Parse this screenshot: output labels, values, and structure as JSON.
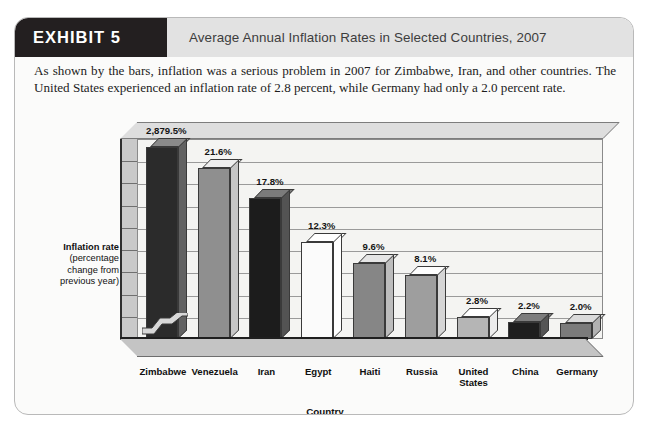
{
  "exhibit": {
    "tag": "EXHIBIT 5",
    "title": "Average Annual Inflation Rates in Selected Countries, 2007",
    "description": "As shown by the bars, inflation was a serious problem in 2007 for Zimbabwe, Iran, and other countries. The United States experienced an inflation rate of 2.8 percent, while Germany had only a 2.0 percent rate."
  },
  "axis_caption": {
    "line1": "Inflation rate",
    "line2": "(percentage",
    "line3": "change from",
    "line4": "previous year)"
  },
  "colors": {
    "tag_background": "#231f20",
    "header_background": "#e2e2e2",
    "card_background": "#fbfbfa",
    "plot_background": "#f4f4f2",
    "wall_gray": "#c9c9c9",
    "floor_gray": "#c4c4c4"
  },
  "chart_data": {
    "type": "bar",
    "title": "Average Annual Inflation Rates in Selected Countries, 2007",
    "xlabel": "Country",
    "ylabel": "Inflation rate (percentage change from previous year)",
    "grid": true,
    "legend": "none",
    "axis_break": true,
    "axis_break_note": "Zimbabwe bar is truncated with a scale-break symbol",
    "ylim": [
      0,
      24
    ],
    "categories": [
      "Zimbabwe",
      "Venezuela",
      "Iran",
      "Egypt",
      "Haiti",
      "Russia",
      "United States",
      "China",
      "Germany"
    ],
    "values": [
      2879.5,
      21.6,
      17.8,
      12.3,
      9.6,
      8.1,
      2.8,
      2.2,
      2.0
    ],
    "data_labels": [
      "2,879.5%",
      "21.6%",
      "17.8%",
      "12.3%",
      "9.6%",
      "8.1%",
      "2.8%",
      "2.2%",
      "2.0%"
    ],
    "bar_colors": [
      "#2b2b2b",
      "#8f8f8f",
      "#1c1c1c",
      "#fbfbfb",
      "#868686",
      "#9e9e9e",
      "#b5b5b5",
      "#1e1e1e",
      "#7b7b7b"
    ]
  },
  "cat_labels": [
    {
      "line1": "Zimbabwe",
      "line2": ""
    },
    {
      "line1": "Venezuela",
      "line2": ""
    },
    {
      "line1": "Iran",
      "line2": ""
    },
    {
      "line1": "Egypt",
      "line2": ""
    },
    {
      "line1": "Haiti",
      "line2": ""
    },
    {
      "line1": "Russia",
      "line2": ""
    },
    {
      "line1": "United",
      "line2": "States"
    },
    {
      "line1": "China",
      "line2": ""
    },
    {
      "line1": "Germany",
      "line2": ""
    }
  ]
}
